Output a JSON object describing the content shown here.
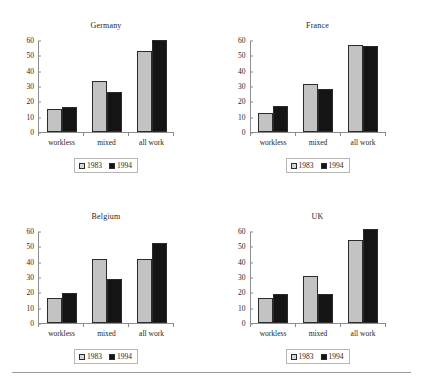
{
  "figure": {
    "categories": [
      "workless",
      "mixed",
      "all work"
    ],
    "series_names": [
      "1983",
      "1994"
    ],
    "y_ticks": [
      "0",
      "10",
      "20",
      "30",
      "40",
      "50",
      "60"
    ],
    "legend": {
      "series1_label": "1983",
      "series2_label": "1994",
      "swatch1": "light-gray-square",
      "swatch2": "black-square"
    },
    "colors": {
      "series1": "#c3c3c3",
      "series2": "#141414",
      "axis": "#8c8c8c",
      "text": "#1f1f1f",
      "rule": "#9a9a9a"
    }
  },
  "chart_data": [
    {
      "type": "bar",
      "title": "Germany",
      "categories": [
        "workless",
        "mixed",
        "all work"
      ],
      "series": [
        {
          "name": "1983",
          "values": [
            15,
            33,
            53
          ]
        },
        {
          "name": "1994",
          "values": [
            16,
            26,
            60
          ]
        }
      ],
      "xlabel": "",
      "ylabel": "",
      "ylim": [
        0,
        60
      ],
      "yticks": [
        0,
        10,
        20,
        30,
        40,
        50,
        60
      ],
      "grid": false,
      "legend_position": "bottom"
    },
    {
      "type": "bar",
      "title": "France",
      "categories": [
        "workless",
        "mixed",
        "all work"
      ],
      "series": [
        {
          "name": "1983",
          "values": [
            12.5,
            31,
            57
          ]
        },
        {
          "name": "1994",
          "values": [
            17,
            28,
            56
          ]
        }
      ],
      "xlabel": "",
      "ylabel": "",
      "ylim": [
        0,
        60
      ],
      "yticks": [
        0,
        10,
        20,
        30,
        40,
        50,
        60
      ],
      "grid": false,
      "legend_position": "bottom"
    },
    {
      "type": "bar",
      "title": "Belgium",
      "categories": [
        "workless",
        "mixed",
        "all work"
      ],
      "series": [
        {
          "name": "1983",
          "values": [
            16,
            42,
            42
          ]
        },
        {
          "name": "1994",
          "values": [
            19.5,
            29,
            52
          ]
        }
      ],
      "xlabel": "",
      "ylabel": "",
      "ylim": [
        0,
        60
      ],
      "yticks": [
        0,
        10,
        20,
        30,
        40,
        50,
        60
      ],
      "grid": false,
      "legend_position": "bottom"
    },
    {
      "type": "bar",
      "title": "UK",
      "categories": [
        "workless",
        "mixed",
        "all work"
      ],
      "series": [
        {
          "name": "1983",
          "values": [
            16,
            30.5,
            54
          ]
        },
        {
          "name": "1994",
          "values": [
            19,
            19,
            61
          ]
        }
      ],
      "xlabel": "",
      "ylabel": "",
      "ylim": [
        0,
        60
      ],
      "yticks": [
        0,
        10,
        20,
        30,
        40,
        50,
        60
      ],
      "grid": false,
      "legend_position": "bottom"
    }
  ]
}
